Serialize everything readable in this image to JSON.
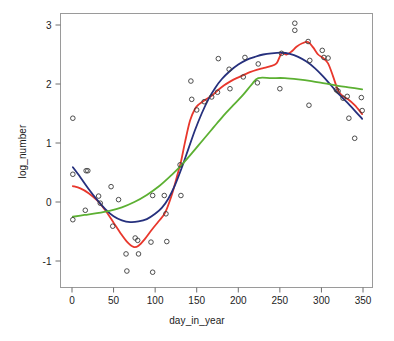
{
  "chart_data": {
    "type": "scatter",
    "title": "",
    "subtitle": "",
    "xlabel": "day_in_year",
    "ylabel": "log_number",
    "xlim": [
      -12,
      362
    ],
    "ylim": [
      -1.42,
      3.25
    ],
    "xticks": [
      0,
      50,
      100,
      150,
      200,
      250,
      300,
      350
    ],
    "xtick_labels": [
      "0",
      "50",
      "100",
      "150",
      "200",
      "250",
      "300",
      "350"
    ],
    "yticks": [
      -1,
      0,
      1,
      2,
      3
    ],
    "ytick_labels": [
      "-1",
      "0",
      "1",
      "2",
      "3"
    ],
    "grid": false,
    "legend": null,
    "legend_position": "none",
    "point_marker": "open-circle",
    "point_color": "#3a3a3a",
    "point_radius": 2.3,
    "points": [
      {
        "x": 1,
        "y": 1.42
      },
      {
        "x": 1,
        "y": 0.47
      },
      {
        "x": 1,
        "y": -0.3
      },
      {
        "x": 16,
        "y": -0.14
      },
      {
        "x": 17,
        "y": 0.53
      },
      {
        "x": 19,
        "y": 0.53
      },
      {
        "x": 32,
        "y": 0.1
      },
      {
        "x": 34,
        "y": -0.02
      },
      {
        "x": 47,
        "y": 0.26
      },
      {
        "x": 49,
        "y": -0.41
      },
      {
        "x": 56,
        "y": 0.04
      },
      {
        "x": 65,
        "y": -0.88
      },
      {
        "x": 66,
        "y": -1.17
      },
      {
        "x": 76,
        "y": -0.61
      },
      {
        "x": 79,
        "y": -0.65
      },
      {
        "x": 80,
        "y": -0.88
      },
      {
        "x": 95,
        "y": -0.68
      },
      {
        "x": 97,
        "y": 0.11
      },
      {
        "x": 97,
        "y": -1.19
      },
      {
        "x": 111,
        "y": 0.11
      },
      {
        "x": 113,
        "y": -0.2
      },
      {
        "x": 114,
        "y": -0.67
      },
      {
        "x": 131,
        "y": 0.11
      },
      {
        "x": 130,
        "y": 0.63
      },
      {
        "x": 143,
        "y": 2.05
      },
      {
        "x": 144,
        "y": 1.74
      },
      {
        "x": 150,
        "y": 1.56
      },
      {
        "x": 159,
        "y": 1.7
      },
      {
        "x": 168,
        "y": 1.78
      },
      {
        "x": 175,
        "y": 1.86
      },
      {
        "x": 176,
        "y": 2.43
      },
      {
        "x": 189,
        "y": 2.25
      },
      {
        "x": 190,
        "y": 1.92
      },
      {
        "x": 206,
        "y": 2.12
      },
      {
        "x": 208,
        "y": 2.45
      },
      {
        "x": 223,
        "y": 2.02
      },
      {
        "x": 224,
        "y": 2.34
      },
      {
        "x": 250,
        "y": 1.92
      },
      {
        "x": 252,
        "y": 2.52
      },
      {
        "x": 268,
        "y": 3.03
      },
      {
        "x": 268,
        "y": 2.91
      },
      {
        "x": 284,
        "y": 2.72
      },
      {
        "x": 285,
        "y": 1.64
      },
      {
        "x": 286,
        "y": 2.4
      },
      {
        "x": 301,
        "y": 2.57
      },
      {
        "x": 303,
        "y": 2.45
      },
      {
        "x": 308,
        "y": 2.44
      },
      {
        "x": 318,
        "y": 1.9
      },
      {
        "x": 320,
        "y": 1.88
      },
      {
        "x": 326,
        "y": 1.76
      },
      {
        "x": 331,
        "y": 1.79
      },
      {
        "x": 333,
        "y": 1.42
      },
      {
        "x": 340,
        "y": 1.08
      },
      {
        "x": 348,
        "y": 1.77
      },
      {
        "x": 349,
        "y": 1.55
      }
    ],
    "series": [
      {
        "name": "red-smoother",
        "color": "#E8372C",
        "width": 1.8,
        "values": [
          {
            "x": 1,
            "y": 0.27
          },
          {
            "x": 10,
            "y": 0.23
          },
          {
            "x": 20,
            "y": 0.15
          },
          {
            "x": 30,
            "y": 0.03
          },
          {
            "x": 40,
            "y": -0.14
          },
          {
            "x": 50,
            "y": -0.35
          },
          {
            "x": 58,
            "y": -0.52
          },
          {
            "x": 66,
            "y": -0.67
          },
          {
            "x": 74,
            "y": -0.76
          },
          {
            "x": 80,
            "y": -0.74
          },
          {
            "x": 88,
            "y": -0.62
          },
          {
            "x": 96,
            "y": -0.47
          },
          {
            "x": 104,
            "y": -0.33
          },
          {
            "x": 112,
            "y": -0.18
          },
          {
            "x": 120,
            "y": 0.12
          },
          {
            "x": 126,
            "y": 0.42
          },
          {
            "x": 131,
            "y": 0.68
          },
          {
            "x": 136,
            "y": 1.02
          },
          {
            "x": 142,
            "y": 1.38
          },
          {
            "x": 148,
            "y": 1.58
          },
          {
            "x": 153,
            "y": 1.66
          },
          {
            "x": 160,
            "y": 1.73
          },
          {
            "x": 168,
            "y": 1.8
          },
          {
            "x": 175,
            "y": 1.89
          },
          {
            "x": 183,
            "y": 1.98
          },
          {
            "x": 190,
            "y": 2.04
          },
          {
            "x": 198,
            "y": 2.1
          },
          {
            "x": 206,
            "y": 2.15
          },
          {
            "x": 214,
            "y": 2.2
          },
          {
            "x": 222,
            "y": 2.24
          },
          {
            "x": 230,
            "y": 2.27
          },
          {
            "x": 238,
            "y": 2.3
          },
          {
            "x": 246,
            "y": 2.35
          },
          {
            "x": 252,
            "y": 2.52
          },
          {
            "x": 258,
            "y": 2.5
          },
          {
            "x": 264,
            "y": 2.55
          },
          {
            "x": 270,
            "y": 2.63
          },
          {
            "x": 277,
            "y": 2.69
          },
          {
            "x": 284,
            "y": 2.71
          },
          {
            "x": 290,
            "y": 2.62
          },
          {
            "x": 296,
            "y": 2.5
          },
          {
            "x": 302,
            "y": 2.44
          },
          {
            "x": 308,
            "y": 2.35
          },
          {
            "x": 314,
            "y": 2.13
          },
          {
            "x": 320,
            "y": 1.89
          },
          {
            "x": 326,
            "y": 1.79
          },
          {
            "x": 332,
            "y": 1.74
          },
          {
            "x": 340,
            "y": 1.64
          },
          {
            "x": 349,
            "y": 1.49
          }
        ]
      },
      {
        "name": "navy-smoother",
        "color": "#26307D",
        "width": 1.8,
        "values": [
          {
            "x": 1,
            "y": 0.59
          },
          {
            "x": 10,
            "y": 0.42
          },
          {
            "x": 20,
            "y": 0.22
          },
          {
            "x": 30,
            "y": 0.04
          },
          {
            "x": 40,
            "y": -0.12
          },
          {
            "x": 50,
            "y": -0.24
          },
          {
            "x": 60,
            "y": -0.31
          },
          {
            "x": 70,
            "y": -0.34
          },
          {
            "x": 80,
            "y": -0.33
          },
          {
            "x": 90,
            "y": -0.29
          },
          {
            "x": 100,
            "y": -0.2
          },
          {
            "x": 108,
            "y": -0.1
          },
          {
            "x": 116,
            "y": 0.06
          },
          {
            "x": 124,
            "y": 0.29
          },
          {
            "x": 132,
            "y": 0.58
          },
          {
            "x": 140,
            "y": 0.9
          },
          {
            "x": 148,
            "y": 1.22
          },
          {
            "x": 156,
            "y": 1.5
          },
          {
            "x": 164,
            "y": 1.74
          },
          {
            "x": 172,
            "y": 1.93
          },
          {
            "x": 180,
            "y": 2.08
          },
          {
            "x": 190,
            "y": 2.22
          },
          {
            "x": 200,
            "y": 2.33
          },
          {
            "x": 210,
            "y": 2.41
          },
          {
            "x": 220,
            "y": 2.46
          },
          {
            "x": 230,
            "y": 2.5
          },
          {
            "x": 240,
            "y": 2.52
          },
          {
            "x": 252,
            "y": 2.53
          },
          {
            "x": 262,
            "y": 2.51
          },
          {
            "x": 272,
            "y": 2.46
          },
          {
            "x": 282,
            "y": 2.38
          },
          {
            "x": 292,
            "y": 2.27
          },
          {
            "x": 302,
            "y": 2.13
          },
          {
            "x": 312,
            "y": 1.97
          },
          {
            "x": 320,
            "y": 1.84
          },
          {
            "x": 330,
            "y": 1.7
          },
          {
            "x": 340,
            "y": 1.55
          },
          {
            "x": 349,
            "y": 1.41
          }
        ]
      },
      {
        "name": "green-smoother",
        "color": "#5CB032",
        "width": 1.8,
        "values": [
          {
            "x": 1,
            "y": -0.25
          },
          {
            "x": 15,
            "y": -0.22
          },
          {
            "x": 30,
            "y": -0.19
          },
          {
            "x": 45,
            "y": -0.15
          },
          {
            "x": 60,
            "y": -0.09
          },
          {
            "x": 75,
            "y": 0.0
          },
          {
            "x": 90,
            "y": 0.12
          },
          {
            "x": 105,
            "y": 0.27
          },
          {
            "x": 120,
            "y": 0.46
          },
          {
            "x": 132,
            "y": 0.63
          },
          {
            "x": 145,
            "y": 0.84
          },
          {
            "x": 158,
            "y": 1.06
          },
          {
            "x": 170,
            "y": 1.26
          },
          {
            "x": 182,
            "y": 1.46
          },
          {
            "x": 194,
            "y": 1.64
          },
          {
            "x": 206,
            "y": 1.82
          },
          {
            "x": 216,
            "y": 1.99
          },
          {
            "x": 224,
            "y": 2.1
          },
          {
            "x": 240,
            "y": 2.1
          },
          {
            "x": 256,
            "y": 2.1
          },
          {
            "x": 272,
            "y": 2.08
          },
          {
            "x": 288,
            "y": 2.05
          },
          {
            "x": 304,
            "y": 2.01
          },
          {
            "x": 320,
            "y": 1.97
          },
          {
            "x": 335,
            "y": 1.94
          },
          {
            "x": 349,
            "y": 1.91
          }
        ]
      }
    ]
  },
  "axes": {
    "frame_color": "#9a9a9a",
    "tick_color": "#6e6e6e",
    "x_title": "day_in_year",
    "y_title": "log_number"
  }
}
